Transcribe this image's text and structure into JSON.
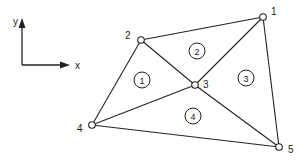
{
  "axes": {
    "origin": [
      22,
      65
    ],
    "x_label": "x",
    "y_label": "y",
    "x_end": [
      70,
      65
    ],
    "y_end": [
      22,
      18
    ]
  },
  "colors": {
    "stroke": "#222222",
    "node_fill": "#ffffff",
    "background": "#ffffff"
  },
  "nodes": [
    {
      "id": "1",
      "x": 263,
      "y": 17,
      "label_dx": 8,
      "label_dy": -2
    },
    {
      "id": "2",
      "x": 141,
      "y": 40,
      "label_dx": -16,
      "label_dy": -1
    },
    {
      "id": "3",
      "x": 195,
      "y": 85,
      "label_dx": 8,
      "label_dy": 3
    },
    {
      "id": "4",
      "x": 92,
      "y": 125,
      "label_dx": -15,
      "label_dy": 7
    },
    {
      "id": "5",
      "x": 279,
      "y": 147,
      "label_dx": 9,
      "label_dy": 6
    }
  ],
  "edges": [
    [
      "1",
      "2"
    ],
    [
      "2",
      "4"
    ],
    [
      "4",
      "5"
    ],
    [
      "5",
      "1"
    ],
    [
      "2",
      "3"
    ],
    [
      "1",
      "3"
    ],
    [
      "3",
      "4"
    ],
    [
      "3",
      "5"
    ]
  ],
  "elements": [
    {
      "id": "1",
      "x": 142,
      "y": 80
    },
    {
      "id": "2",
      "x": 197,
      "y": 51
    },
    {
      "id": "3",
      "x": 246,
      "y": 78
    },
    {
      "id": "4",
      "x": 193,
      "y": 116
    }
  ]
}
